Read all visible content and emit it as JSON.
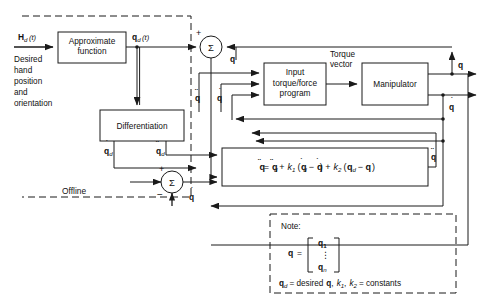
{
  "diagram": {
    "blocks": {
      "approximate_function": "Approximate\nfunction",
      "approximate_function_l1": "Approximate",
      "approximate_function_l2": "function",
      "differentiation": "Differentiation",
      "input_torque_program_l1": "Input",
      "input_torque_program_l2": "torque/force",
      "input_torque_program_l3": "program",
      "manipulator": "Manipulator"
    },
    "signals": {
      "input": "H",
      "input_sub": "d",
      "input_arg": "(t)",
      "input_description_lines": [
        "Desired",
        "hand",
        "position",
        "and",
        "orientation"
      ],
      "qd_t": "q",
      "qd_t_sub": "d",
      "qd_t_arg": "(t)",
      "qd_dot": "q",
      "qd_dot_sub": "d",
      "qdd_dot": "q",
      "qdd_dot_sub": "d",
      "q": "q",
      "q_dot": "q",
      "q_ddot": "q",
      "torque_vector_l1": "Torque",
      "torque_vector_l2": "vector",
      "offline": "Offline",
      "sigma": "Σ",
      "plus": "+",
      "minus": "−"
    },
    "equation": {
      "lhs": "q",
      "full_text": "q̈ = q̈d + k1 (q̇d − q̇) + k2 (qd − q)",
      "parts": {
        "eq": "=",
        "plus": "+",
        "minus": "−",
        "k1": "k",
        "k1_sub": "1",
        "k2": "k",
        "k2_sub": "2",
        "d": "d",
        "lparen": "(",
        "rparen": ")"
      }
    },
    "note": {
      "heading": "Note:",
      "q_label": "q",
      "equals": "=",
      "vector_top": "q",
      "vector_top_sub": "1",
      "vector_dots": "⋮",
      "vector_bottom": "q",
      "vector_bottom_sub": "n",
      "line2_a": "q",
      "line2_a_sub": "d",
      "line2_b": "= desired",
      "line2_c": "q",
      "line2_d": ",",
      "line2_e": "k",
      "line2_e_sub": "1",
      "line2_f": ",",
      "line2_g": "k",
      "line2_g_sub": "2",
      "line2_h": "= constants"
    },
    "colors": {
      "line": "#1a1a1a",
      "block_fill": "#ffffff",
      "background": "#ffffff",
      "text": "#111111"
    }
  }
}
